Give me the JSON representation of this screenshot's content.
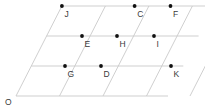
{
  "figure": {
    "kind": "parallelogram-lattice-grid",
    "width": 205,
    "height": 111,
    "background_color": "#ffffff",
    "line_color": "#c9c9c9",
    "dot_color": "#111111",
    "label_color": "#3a3a3a",
    "rows": 3,
    "columns": 4,
    "origin": {
      "label": "O",
      "x": 16,
      "y": 96,
      "label_x": 5,
      "label_y": 105
    },
    "basis": {
      "across_dx": 43.5,
      "across_dy": 0,
      "up_dx": 15.3,
      "up_dy": -30
    },
    "horizontal_lines": [
      {
        "name": "row-0-baseline",
        "x1": 16,
        "y1": 96,
        "x2": 168,
        "y2": 96
      },
      {
        "name": "row-1-line",
        "x1": 31.3,
        "y1": 66,
        "x2": 183.3,
        "y2": 66
      },
      {
        "name": "row-2-line",
        "x1": 46.6,
        "y1": 36,
        "x2": 198.6,
        "y2": 36
      },
      {
        "name": "row-3-topline",
        "x1": 61.9,
        "y1": 6,
        "x2": 213.9,
        "y2": 6
      }
    ],
    "slanted_lines": [
      {
        "name": "col-0-left-edge",
        "x1": 16,
        "y1": 96,
        "x2": 61.9,
        "y2": 6
      },
      {
        "name": "col-1-line",
        "x1": 59.5,
        "y1": 96,
        "x2": 105.4,
        "y2": 6
      },
      {
        "name": "col-2-line",
        "x1": 103,
        "y1": 96,
        "x2": 148.9,
        "y2": 6
      },
      {
        "name": "col-3-line",
        "x1": 146.5,
        "y1": 96,
        "x2": 192.4,
        "y2": 6
      },
      {
        "name": "col-4-right-edge",
        "x1": 190,
        "y1": 96,
        "x2": 235.9,
        "y2": 6
      }
    ],
    "labeled_points": [
      {
        "id": "J",
        "label": "J",
        "x": 61.9,
        "y": 6,
        "label_x": 64.5,
        "label_y": 17
      },
      {
        "id": "C",
        "label": "C",
        "x": 134.6,
        "y": 6,
        "label_x": 137.2,
        "label_y": 17
      },
      {
        "id": "F",
        "label": "F",
        "x": 170.5,
        "y": 6,
        "label_x": 173.1,
        "label_y": 17
      },
      {
        "id": "E",
        "label": "E",
        "x": 82.0,
        "y": 36,
        "label_x": 84.6,
        "label_y": 47
      },
      {
        "id": "H",
        "label": "H",
        "x": 117.0,
        "y": 36,
        "label_x": 119.6,
        "label_y": 47
      },
      {
        "id": "I",
        "label": "I",
        "x": 154.0,
        "y": 36,
        "label_x": 156.6,
        "label_y": 47
      },
      {
        "id": "G",
        "label": "G",
        "x": 65.0,
        "y": 66,
        "label_x": 67.6,
        "label_y": 77
      },
      {
        "id": "D",
        "label": "D",
        "x": 101.0,
        "y": 66,
        "label_x": 103.6,
        "label_y": 77
      },
      {
        "id": "K",
        "label": "K",
        "x": 171.0,
        "y": 66,
        "label_x": 173.6,
        "label_y": 77
      }
    ],
    "dot_radius": 1.9
  }
}
